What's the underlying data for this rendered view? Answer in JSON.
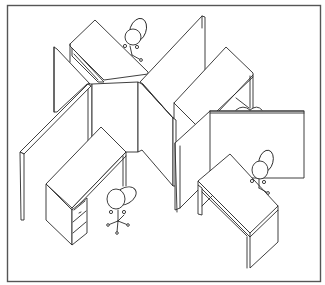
{
  "figure": {
    "title": "Four-station office cubicle workstation cluster (isometric line drawing)",
    "style": "black line art on white with rectangular border",
    "colors": {
      "line": "#2a2a2a",
      "border": "#555555",
      "background": "#ffffff"
    },
    "components": [
      {
        "id": "cubicle-top",
        "items": [
          "desk",
          "task-chair"
        ]
      },
      {
        "id": "cubicle-left",
        "items": [
          "desk",
          "drawer-pedestal",
          "task-chair"
        ]
      },
      {
        "id": "cubicle-right",
        "items": [
          "desk",
          "task-chair"
        ]
      },
      {
        "id": "cubicle-rear-right",
        "items": [
          "desk",
          "task-chair (partially hidden)"
        ]
      }
    ],
    "panels": "X-shaped partition panels dividing four workstations",
    "pedestal_drawers": 3
  }
}
